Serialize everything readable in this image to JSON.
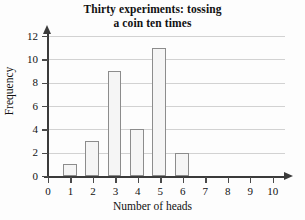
{
  "chart_data": {
    "type": "bar",
    "title": "Thirty experiments: tossing a coin ten times",
    "title_lines": [
      "Thirty experiments: tossing",
      "a coin ten times"
    ],
    "xlabel": "Number of heads",
    "ylabel": "Frequency",
    "categories": [
      "0",
      "1",
      "2",
      "3",
      "4",
      "5",
      "6",
      "7",
      "8",
      "9",
      "10"
    ],
    "values": [
      0,
      1,
      3,
      9,
      4,
      11,
      2,
      0,
      0,
      0,
      0
    ],
    "x_tick_labels": [
      "0",
      "1",
      "2",
      "3",
      "4",
      "5",
      "6",
      "7",
      "8",
      "9",
      "10"
    ],
    "y_tick_labels": [
      "0",
      "2",
      "4",
      "6",
      "8",
      "10",
      "12"
    ],
    "y_tick_values": [
      0,
      2,
      4,
      6,
      8,
      10,
      12
    ],
    "xlim": [
      0,
      10
    ],
    "ylim": [
      0,
      12
    ],
    "grid": "horizontal",
    "legend": "none",
    "bar_fill_color": "#f5f5f5",
    "bar_border_color": "#8c8c8c",
    "gridline_color": "#d2d2d2",
    "axis_color": "#3b3b3b",
    "background_color": "#fdfdfd",
    "total_experiments": 30
  }
}
